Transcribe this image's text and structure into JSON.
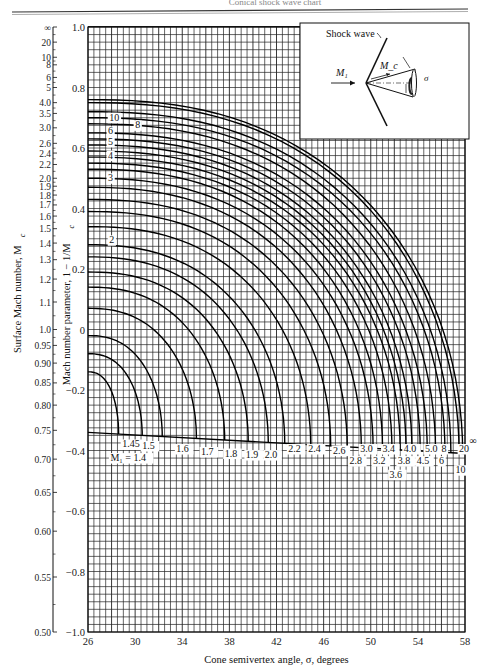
{
  "header": {
    "running_title": "Conical shock wave chart"
  },
  "chart_data": {
    "type": "line",
    "title": "",
    "xlabel": "Cone semivertex angle, σ, degrees",
    "ylabel": "Mach number parameter, 1 − 1/M_c",
    "ylabel_outer": "Surface Mach number, M_c",
    "xlim": [
      26,
      58
    ],
    "ylim": [
      -1.0,
      1.0
    ],
    "grid": true,
    "x_ticks": [
      26,
      30,
      34,
      38,
      42,
      46,
      50,
      54,
      58
    ],
    "y_ticks": [
      1.0,
      0.8,
      0.6,
      0.4,
      0.2,
      0,
      -0.2,
      -0.4,
      -0.6,
      -0.8,
      -1.0
    ],
    "y_tick_labels": [
      "1.0",
      "0.8",
      "0.6",
      "0.4",
      "0.2",
      "0",
      "−0.2",
      "−0.4",
      "−0.6",
      "−0.8",
      "−1.0"
    ],
    "mc_scale": [
      {
        "label": "∞",
        "v": 1.0
      },
      {
        "label": "20",
        "v": 0.95
      },
      {
        "label": "10",
        "v": 0.9
      },
      {
        "label": "8",
        "v": 0.875
      },
      {
        "label": "6",
        "v": 0.8333
      },
      {
        "label": "5",
        "v": 0.8
      },
      {
        "label": "4.0",
        "v": 0.75
      },
      {
        "label": "3.5",
        "v": 0.7143
      },
      {
        "label": "3.0",
        "v": 0.6667
      },
      {
        "label": "2.6",
        "v": 0.6154
      },
      {
        "label": "2.4",
        "v": 0.5833
      },
      {
        "label": "2.2",
        "v": 0.5455
      },
      {
        "label": "2.0",
        "v": 0.5
      },
      {
        "label": "1.9",
        "v": 0.4737
      },
      {
        "label": "1.8",
        "v": 0.4444
      },
      {
        "label": "1.7",
        "v": 0.4118
      },
      {
        "label": "1.6",
        "v": 0.375
      },
      {
        "label": "1.5",
        "v": 0.3333
      },
      {
        "label": "1.4",
        "v": 0.2857
      },
      {
        "label": "1.3",
        "v": 0.2308
      },
      {
        "label": "1.2",
        "v": 0.1667
      },
      {
        "label": "1.1",
        "v": 0.0909
      },
      {
        "label": "1.0",
        "v": 0.0
      },
      {
        "label": "0.95",
        "v": -0.0526
      },
      {
        "label": "0.90",
        "v": -0.1111
      },
      {
        "label": "0.85",
        "v": -0.1765
      },
      {
        "label": "0.80",
        "v": -0.25
      },
      {
        "label": "0.75",
        "v": -0.3333
      },
      {
        "label": "0.70",
        "v": -0.4286
      },
      {
        "label": "0.65",
        "v": -0.5385
      },
      {
        "label": "0.60",
        "v": -0.6667
      },
      {
        "label": "0.55",
        "v": -0.8182
      },
      {
        "label": "0.50",
        "v": -1.0
      }
    ],
    "series": [
      {
        "name": "∞",
        "start_v": 0.76,
        "end_theta": 57.8
      },
      {
        "name": "20",
        "start_v": 0.75,
        "end_theta": 57.5
      },
      {
        "name": "10",
        "start_v": 0.72,
        "end_theta": 56.8
      },
      {
        "name": "8",
        "start_v": 0.7,
        "end_theta": 56.3
      },
      {
        "name": "6",
        "start_v": 0.68,
        "end_theta": 55.5
      },
      {
        "name": "5",
        "start_v": 0.65,
        "end_theta": 54.8
      },
      {
        "name": "4.5",
        "start_v": 0.63,
        "end_theta": 54.2
      },
      {
        "name": "4.0",
        "start_v": 0.61,
        "end_theta": 53.5
      },
      {
        "name": "3.8",
        "start_v": 0.59,
        "end_theta": 53.0
      },
      {
        "name": "3.6",
        "start_v": 0.57,
        "end_theta": 52.5
      },
      {
        "name": "3.4",
        "start_v": 0.55,
        "end_theta": 51.8
      },
      {
        "name": "3.2",
        "start_v": 0.53,
        "end_theta": 51.0
      },
      {
        "name": "3.0",
        "start_v": 0.5,
        "end_theta": 50.2
      },
      {
        "name": "2.8",
        "start_v": 0.47,
        "end_theta": 49.2
      },
      {
        "name": "2.6",
        "start_v": 0.43,
        "end_theta": 48.0
      },
      {
        "name": "2.4",
        "start_v": 0.39,
        "end_theta": 46.6
      },
      {
        "name": "2.2",
        "start_v": 0.34,
        "end_theta": 44.9
      },
      {
        "name": "2.0",
        "start_v": 0.28,
        "end_theta": 42.7
      },
      {
        "name": "1.9",
        "start_v": 0.24,
        "end_theta": 41.3
      },
      {
        "name": "1.8",
        "start_v": 0.19,
        "end_theta": 39.6
      },
      {
        "name": "1.7",
        "start_v": 0.14,
        "end_theta": 37.6
      },
      {
        "name": "1.6",
        "start_v": 0.07,
        "end_theta": 35.2
      },
      {
        "name": "1.5",
        "start_v": -0.02,
        "end_theta": 32.3
      },
      {
        "name": "1.45",
        "start_v": -0.08,
        "end_theta": 30.6
      },
      {
        "name": "1.4",
        "start_v": -0.14,
        "end_theta": 28.6
      }
    ],
    "detachment_line": {
      "theta": [
        26,
        58
      ],
      "v": [
        -0.34,
        -0.41
      ]
    },
    "curve_labels_left": [
      {
        "text": "10",
        "theta": 27.8,
        "v": 0.69
      },
      {
        "text": "8",
        "theta": 30.0,
        "v": 0.665
      },
      {
        "text": "6",
        "theta": 27.7,
        "v": 0.645
      },
      {
        "text": "5",
        "theta": 27.7,
        "v": 0.61
      },
      {
        "text": "4",
        "theta": 27.7,
        "v": 0.565
      },
      {
        "text": "3",
        "theta": 27.7,
        "v": 0.49
      },
      {
        "text": "2",
        "theta": 27.8,
        "v": 0.285
      }
    ],
    "m1_labels": [
      {
        "text": "M₁ = 1.4",
        "theta": 27.9,
        "v": -0.435
      },
      {
        "text": "1.45",
        "theta": 28.9,
        "v": -0.39
      },
      {
        "text": "1.5",
        "theta": 30.6,
        "v": -0.395
      },
      {
        "text": "1.6",
        "theta": 33.5,
        "v": -0.405
      },
      {
        "text": "1.7",
        "theta": 35.6,
        "v": -0.415
      },
      {
        "text": "1.8",
        "theta": 37.6,
        "v": -0.42
      },
      {
        "text": "1.9",
        "theta": 39.4,
        "v": -0.425
      },
      {
        "text": "2.0",
        "theta": 41.0,
        "v": -0.425
      },
      {
        "text": "2.2",
        "theta": 43.0,
        "v": -0.405
      },
      {
        "text": "2.4",
        "theta": 44.7,
        "v": -0.405
      },
      {
        "text": "2.6",
        "theta": 46.8,
        "v": -0.41
      },
      {
        "text": "2.8",
        "theta": 48.2,
        "v": -0.445
      },
      {
        "text": "3.0",
        "theta": 49.1,
        "v": -0.405
      },
      {
        "text": "3.2",
        "theta": 50.2,
        "v": -0.445
      },
      {
        "text": "3.4",
        "theta": 51.0,
        "v": -0.405
      },
      {
        "text": "3.6",
        "theta": 51.6,
        "v": -0.49
      },
      {
        "text": "3.8",
        "theta": 52.3,
        "v": -0.445
      },
      {
        "text": "4.0",
        "theta": 52.8,
        "v": -0.405
      },
      {
        "text": "4.5",
        "theta": 53.9,
        "v": -0.445
      },
      {
        "text": "5.0",
        "theta": 54.6,
        "v": -0.405
      },
      {
        "text": "6",
        "theta": 55.8,
        "v": -0.445
      },
      {
        "text": "8",
        "theta": 56.0,
        "v": -0.405
      },
      {
        "text": "10",
        "theta": 57.2,
        "v": -0.475
      },
      {
        "text": "20",
        "theta": 57.5,
        "v": -0.405
      },
      {
        "text": "∞",
        "theta": 59.4,
        "v": -0.38
      }
    ],
    "inset": {
      "labels": {
        "shock": "Shock wave",
        "m1": "M₁",
        "mc": "M_c",
        "sigma": "σ"
      }
    }
  }
}
